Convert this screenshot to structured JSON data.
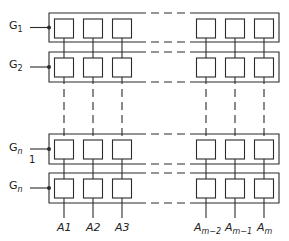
{
  "diagram": {
    "type": "memory-cell-array",
    "rows": [
      {
        "label": "G",
        "sub": "1",
        "y_top": 13,
        "y_bot": 42
      },
      {
        "label": "G",
        "sub": "2",
        "y_top": 52,
        "y_bot": 82
      },
      {
        "label": "G",
        "sub": "n",
        "note": "1",
        "y_top": 134,
        "y_bot": 164
      },
      {
        "label": "G",
        "sub": "n",
        "y_top": 173,
        "y_bot": 203
      }
    ],
    "columns": [
      {
        "label": "A",
        "sub": "1",
        "x": 64
      },
      {
        "label": "A",
        "sub": "2",
        "x": 93
      },
      {
        "label": "A",
        "sub": "3",
        "x": 122
      },
      {
        "label": "A",
        "sub": "m−2",
        "x": 206
      },
      {
        "label": "A",
        "sub": "m−1",
        "x": 235
      },
      {
        "label": "A",
        "sub": "m",
        "x": 264
      }
    ],
    "box_left": 49,
    "box_right": 279,
    "gap_left": 138,
    "gap_right": 190,
    "cell_size": 19,
    "cell_inset": 6,
    "line_color": "#2b2b2b"
  },
  "labels": {
    "g1": "G",
    "g1_sub": "1",
    "g2": "G",
    "g2_sub": "2",
    "gn1": "G",
    "gn1_sub": "n",
    "gn1_note": "1",
    "gn2": "G",
    "gn2_sub": "n",
    "a1": "A1",
    "a2": "A2",
    "a3": "A3",
    "am2": "A",
    "am2_sub": "m−2",
    "am1": "A",
    "am1_sub": "m−1",
    "am": "A",
    "am_sub": "m"
  }
}
